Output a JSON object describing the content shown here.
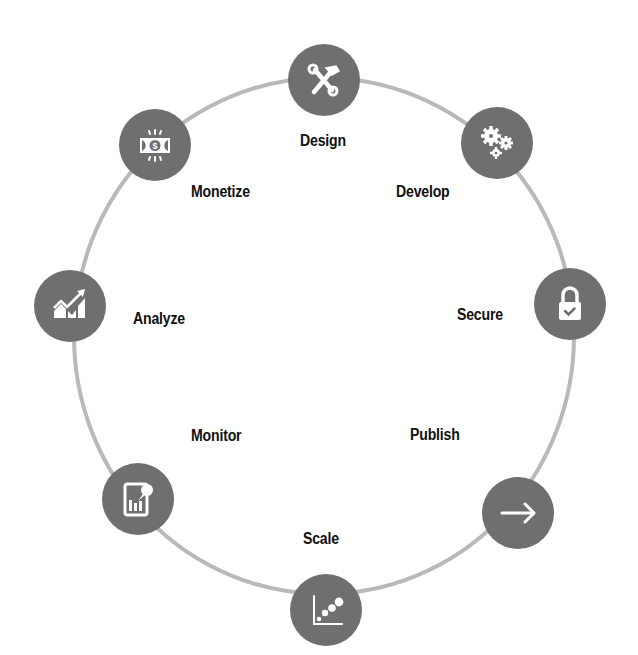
{
  "diagram": {
    "type": "cycle",
    "colors": {
      "ring": "#b9b9b9",
      "node_fill": "#6f6f6f",
      "icon": "#ffffff",
      "label": "#111111"
    },
    "steps": [
      {
        "label": "Design",
        "icon": "hammer-wrench-icon"
      },
      {
        "label": "Develop",
        "icon": "gears-icon"
      },
      {
        "label": "Secure",
        "icon": "padlock-check-icon"
      },
      {
        "label": "Publish",
        "icon": "arrow-right-icon"
      },
      {
        "label": "Scale",
        "icon": "scatter-plot-icon"
      },
      {
        "label": "Monitor",
        "icon": "tablet-chart-icon"
      },
      {
        "label": "Analyze",
        "icon": "trend-chart-icon"
      },
      {
        "label": "Monetize",
        "icon": "money-bill-icon"
      }
    ]
  }
}
